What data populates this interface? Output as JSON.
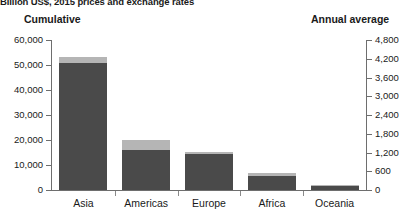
{
  "subtitle": "Billion US$, 2015 prices and exchange rates",
  "left_header": "Cumulative",
  "right_header": "Annual average",
  "axis_left_ticks": [
    "60,000",
    "50,000",
    "40,000",
    "30,000",
    "20,000",
    "10,000",
    "0"
  ],
  "axis_right_ticks": [
    "4,800",
    "4,200",
    "3,600",
    "3,000",
    "2,400",
    "1,800",
    "1,200",
    "600",
    "0"
  ],
  "categories": [
    "Asia",
    "Americas",
    "Europe",
    "Africa",
    "Oceania"
  ],
  "colors": {
    "dark": "#4a4a4a",
    "light": "#b5b5b5",
    "axis": "#6e6e6e",
    "text": "#1a1a1a"
  },
  "chart_data": {
    "type": "bar",
    "title": "",
    "subtitle": "Billion US$, 2015 prices and exchange rates",
    "xlabel": "",
    "ylabel": "Cumulative",
    "y2label": "Annual average",
    "ylim": [
      0,
      60000
    ],
    "y2lim": [
      0,
      4800
    ],
    "ytick_labels": [
      "0",
      "10,000",
      "20,000",
      "30,000",
      "40,000",
      "50,000",
      "60,000"
    ],
    "y2tick_labels": [
      "0",
      "600",
      "1,200",
      "1,800",
      "2,400",
      "3,000",
      "3,600",
      "4,200",
      "4,800"
    ],
    "grid": false,
    "legend": null,
    "stacked": true,
    "categories": [
      "Asia",
      "Americas",
      "Europe",
      "Africa",
      "Oceania"
    ],
    "series": [
      {
        "name": "Cumulative (lower segment)",
        "color": "#4a4a4a",
        "values": [
          50800,
          16000,
          14400,
          5600,
          1600
        ]
      },
      {
        "name": "Annual average (upper segment)",
        "color": "#b5b5b5",
        "values": [
          2400,
          4000,
          800,
          1200,
          400
        ]
      }
    ],
    "totals": [
      53200,
      20000,
      15200,
      6800,
      2000
    ]
  }
}
